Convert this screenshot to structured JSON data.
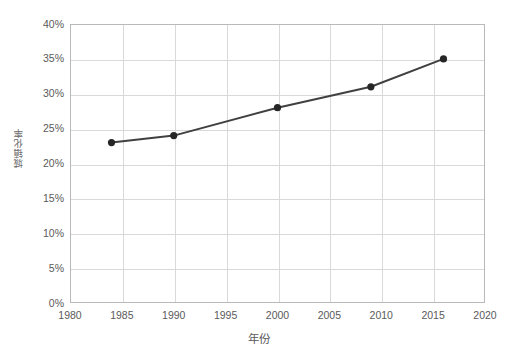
{
  "chart_data": {
    "type": "line",
    "title": "",
    "xlabel": "年份",
    "ylabel": "城镇化率",
    "xlim": [
      1980,
      2020
    ],
    "ylim": [
      0,
      40
    ],
    "grid": true,
    "legend": false,
    "x_ticks": [
      "1980",
      "1985",
      "1990",
      "1995",
      "2000",
      "2005",
      "2010",
      "2015",
      "2020"
    ],
    "x_tick_values": [
      1980,
      1985,
      1990,
      1995,
      2000,
      2005,
      2010,
      2015,
      2020
    ],
    "y_ticks": [
      "0%",
      "5%",
      "10%",
      "15%",
      "20%",
      "25%",
      "30%",
      "35%",
      "40%"
    ],
    "y_tick_values": [
      0,
      5,
      10,
      15,
      20,
      25,
      30,
      35,
      40
    ],
    "series": [
      {
        "name": "",
        "color": "#404040",
        "marker": "circle",
        "x": [
          1984,
          1990,
          2000,
          2009,
          2016
        ],
        "y": [
          23,
          24,
          28,
          31,
          35
        ],
        "points": [
          {
            "x": 1984,
            "y": 23,
            "label": "23%"
          },
          {
            "x": 1990,
            "y": 24,
            "label": "24%"
          },
          {
            "x": 2000,
            "y": 28,
            "label": "28%"
          },
          {
            "x": 2009,
            "y": 31,
            "label": "31%"
          },
          {
            "x": 2016,
            "y": 35,
            "label": "35%"
          }
        ]
      }
    ]
  },
  "style": {
    "line_color": "#404040",
    "marker_color": "#262626",
    "grid_color": "#d9d9d9",
    "frame_color": "#b9b9b9",
    "text_color": "#5a5a5a",
    "background": "#ffffff"
  }
}
